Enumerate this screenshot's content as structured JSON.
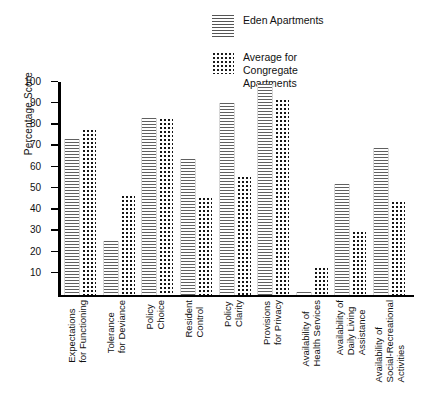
{
  "chart_data": {
    "type": "bar",
    "title": "",
    "xlabel": "",
    "ylabel": "Percentage Score",
    "ylim": [
      0,
      100
    ],
    "yticks": [
      10,
      20,
      30,
      40,
      50,
      60,
      70,
      80,
      90,
      100
    ],
    "grid": false,
    "legend_position": "top-right",
    "categories": [
      "Expectations for Functioning",
      "Tolerance for Deviance",
      "Policy Choice",
      "Resident Control",
      "Policy Clarity",
      "Provisions for Privacy",
      "Availability of Health Services",
      "Availability of Daily Living Assistance",
      "Availability of Social-Recreational Activities"
    ],
    "category_lines": [
      [
        "Expectations",
        "for Functioning"
      ],
      [
        "Tolerance",
        "for Deviance"
      ],
      [
        "Policy",
        "Choice"
      ],
      [
        "Resident",
        "Control"
      ],
      [
        "Policy",
        "Clarity"
      ],
      [
        "Provisions",
        "for Privacy"
      ],
      [
        "Availability of",
        "Health Services"
      ],
      [
        "Availability of",
        "Daily Living",
        "Assistance"
      ],
      [
        "Availability of",
        "Social-Recreational",
        "Activities"
      ]
    ],
    "series": [
      {
        "name": "Eden Apartments",
        "pattern": "horizontal-lines",
        "values": [
          73,
          25,
          83,
          64,
          90,
          99,
          1,
          52,
          69
        ]
      },
      {
        "name": "Average for Congregate Apartments",
        "pattern": "dots",
        "values": [
          78,
          47,
          83,
          46,
          56,
          92,
          13,
          30,
          44
        ]
      }
    ]
  },
  "legend": {
    "items": [
      {
        "label": "Eden Apartments",
        "swatch": "hatch-swatch-icon"
      },
      {
        "label": "Average for Congregate Apartments",
        "swatch": "dots-swatch-icon"
      }
    ],
    "item2_lines": [
      "Average for",
      "Congregate",
      "Apartments"
    ]
  },
  "axes": {
    "y_title": "Percentage Score",
    "y_tick_labels": [
      "100",
      "90",
      "80",
      "70",
      "60",
      "50",
      "40",
      "30",
      "20",
      "10"
    ]
  }
}
